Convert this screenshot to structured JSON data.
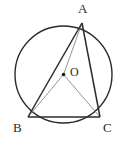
{
  "figure": {
    "type": "geometry-diagram",
    "background_color": "#ffffff",
    "stroke_color": "#2b2b2b",
    "radius_stroke_color": "#7a7a7a",
    "canvas": {
      "width": 126,
      "height": 145
    }
  },
  "circle": {
    "name": "circumscribed-circle",
    "cx": 63.5,
    "cy": 74.5,
    "r": 48.5,
    "stroke_width": 1.4
  },
  "points": {
    "A": {
      "label": "A",
      "x": 82,
      "y": 23
    },
    "B": {
      "label": "B",
      "x": 28,
      "y": 117
    },
    "C": {
      "label": "C",
      "x": 100,
      "y": 117
    },
    "O": {
      "label": "O",
      "x": 63.5,
      "y": 74.5,
      "dot_radius": 1.8
    }
  },
  "segments": [
    {
      "name": "AB",
      "from": "A",
      "to": "B",
      "style": "thick",
      "stroke_width": 1.5
    },
    {
      "name": "AC",
      "from": "A",
      "to": "C",
      "style": "thick",
      "stroke_width": 1.5
    },
    {
      "name": "BC",
      "from": "B",
      "to": "C",
      "style": "thick",
      "stroke_width": 1.5
    },
    {
      "name": "OA",
      "from": "O",
      "to": "A",
      "style": "thin",
      "stroke_width": 0.8
    },
    {
      "name": "OB",
      "from": "O",
      "to": "B",
      "style": "thin",
      "stroke_width": 0.8
    },
    {
      "name": "OC",
      "from": "O",
      "to": "C",
      "style": "thin",
      "stroke_width": 0.8
    }
  ]
}
